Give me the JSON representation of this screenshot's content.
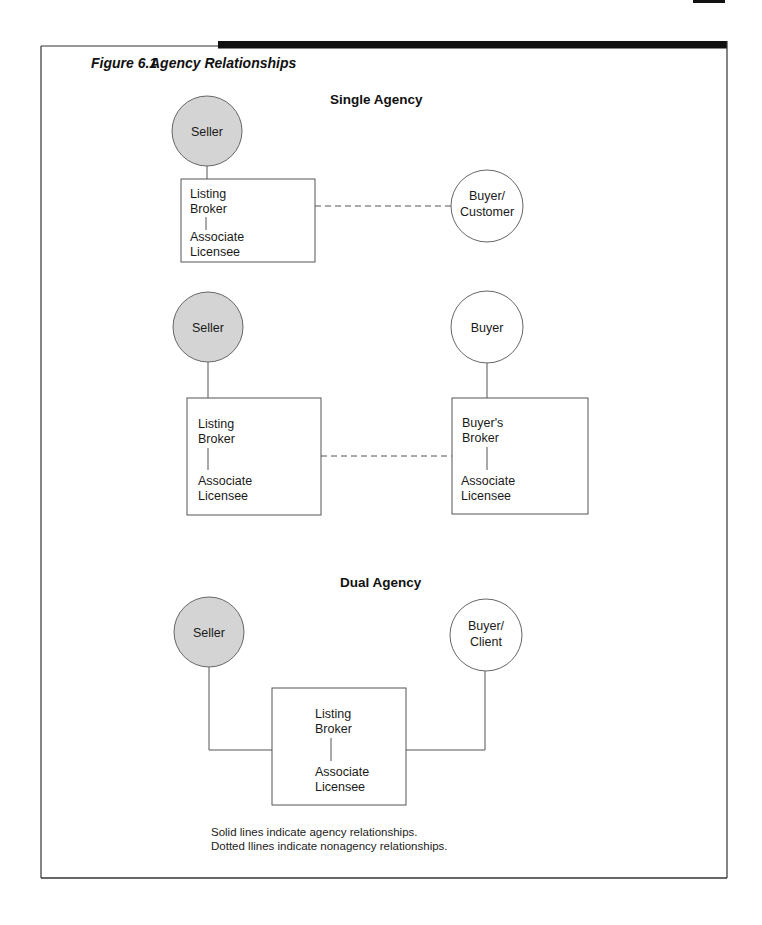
{
  "figure": {
    "number": "Figure 6.1",
    "title": "Agency Relationships"
  },
  "colors": {
    "seller_fill": "#d4d4d4",
    "buyer_fill": "#ffffff",
    "line": "#555555",
    "frame": "#333333",
    "header_bar": "#111111"
  },
  "single_agency": {
    "heading": "Single Agency",
    "diagram1": {
      "seller": "Seller",
      "box": {
        "line1": "Listing",
        "line2": "Broker",
        "line3": "Associate",
        "line4": "Licensee"
      },
      "buyer": {
        "line1": "Buyer/",
        "line2": "Customer"
      },
      "connection": "dotted"
    },
    "diagram2": {
      "seller": "Seller",
      "listing_box": {
        "line1": "Listing",
        "line2": "Broker",
        "line3": "Associate",
        "line4": "Licensee"
      },
      "buyer": "Buyer",
      "buyer_box": {
        "line1": "Buyer's",
        "line2": "Broker",
        "line3": "Associate",
        "line4": "Licensee"
      },
      "connection": "dotted"
    }
  },
  "dual_agency": {
    "heading": "Dual Agency",
    "seller": "Seller",
    "box": {
      "line1": "Listing",
      "line2": "Broker",
      "line3": "Associate",
      "line4": "Licensee"
    },
    "buyer": {
      "line1": "Buyer/",
      "line2": "Client"
    },
    "connection": "solid"
  },
  "legend": {
    "solid": "Solid lines indicate agency relationships.",
    "dotted": "Dotted llines indicate nonagency relationships."
  }
}
